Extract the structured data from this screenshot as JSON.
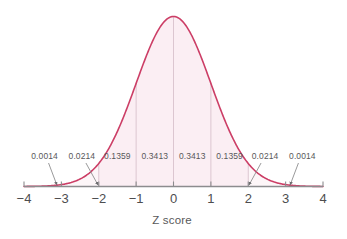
{
  "chart_data": {
    "type": "area",
    "title": "",
    "subtitle": "",
    "xlabel": "Z score",
    "ylabel": "",
    "xlim": [
      -4,
      4
    ],
    "ylim": [
      0,
      0.4
    ],
    "grid": false,
    "legend": null,
    "curve": {
      "name": "standard normal density",
      "distribution": "normal",
      "mean": 0,
      "sd": 1,
      "line_color": "#cc3e66",
      "fill_color": "#fbeef3",
      "fill_range": [
        -2,
        2
      ]
    },
    "x_ticks": [
      -4,
      -3,
      -2,
      -1,
      0,
      1,
      2,
      3,
      4
    ],
    "x_tick_labels": [
      "−4",
      "−3",
      "−2",
      "−1",
      "0",
      "1",
      "2",
      "3",
      "4"
    ],
    "dividers": [
      -2,
      -1,
      0,
      1,
      2
    ],
    "segments": [
      {
        "range": [
          -4,
          -3
        ],
        "area": "0.0014",
        "callout": true,
        "label_x": -3.45,
        "arrow_to": -3.12
      },
      {
        "range": [
          -3,
          -2
        ],
        "area": "0.0214",
        "callout": true,
        "label_x": -2.45,
        "arrow_to": -2.02
      },
      {
        "range": [
          -2,
          -1
        ],
        "area": "0.1359",
        "callout": false,
        "label_x": -1.5,
        "arrow_to": null
      },
      {
        "range": [
          -1,
          0
        ],
        "area": "0.3413",
        "callout": false,
        "label_x": -0.5,
        "arrow_to": null
      },
      {
        "range": [
          0,
          1
        ],
        "area": "0.3413",
        "callout": false,
        "label_x": 0.5,
        "arrow_to": null
      },
      {
        "range": [
          1,
          2
        ],
        "area": "0.1359",
        "callout": false,
        "label_x": 1.5,
        "arrow_to": null
      },
      {
        "range": [
          2,
          3
        ],
        "area": "0.0214",
        "callout": true,
        "label_x": 2.45,
        "arrow_to": 2.02
      },
      {
        "range": [
          3,
          4
        ],
        "area": "0.0014",
        "callout": true,
        "label_x": 3.45,
        "arrow_to": 3.12
      }
    ],
    "area_labels": [
      "0.0014",
      "0.0214",
      "0.1359",
      "0.3413",
      "0.3413",
      "0.1359",
      "0.0214",
      "0.0014"
    ],
    "colors": {
      "background": "#ffffff",
      "curve": "#cc3e66",
      "fill": "#fbeef3",
      "axis": "#8c8c8e",
      "divider": "#d9c3cd",
      "text": "#4d4d4f",
      "label_text": "#58585a",
      "leader": "#8e8e90"
    }
  }
}
